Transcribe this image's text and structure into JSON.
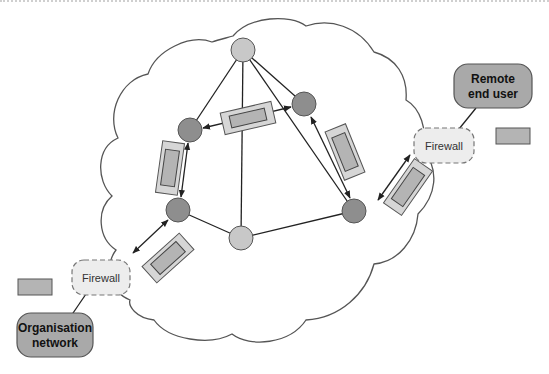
{
  "diagram": {
    "type": "network-vpn-cloud",
    "colors": {
      "cloud_stroke": "#555555",
      "node_light": "#c8c8c8",
      "node_dark": "#8e8e8e",
      "node_stroke": "#555555",
      "packet_outer": "#d6d6d6",
      "packet_inner": "#b4b4b4",
      "endpoint_fill": "#a9a9a9",
      "firewall_fill": "#ededed",
      "line": "#222222"
    },
    "endpoints": [
      {
        "id": "remote",
        "line1": "Remote",
        "line2": "end user"
      },
      {
        "id": "org",
        "line1": "Organisation",
        "line2": "network"
      }
    ],
    "firewalls": [
      {
        "id": "fw-remote",
        "label": "Firewall"
      },
      {
        "id": "fw-org",
        "label": "Firewall"
      }
    ],
    "nodes": [
      {
        "id": "top",
        "shade": "light"
      },
      {
        "id": "upper-left",
        "shade": "dark"
      },
      {
        "id": "upper-right",
        "shade": "dark"
      },
      {
        "id": "lower-left",
        "shade": "dark"
      },
      {
        "id": "bottom",
        "shade": "light"
      },
      {
        "id": "lower-right",
        "shade": "dark"
      }
    ]
  }
}
